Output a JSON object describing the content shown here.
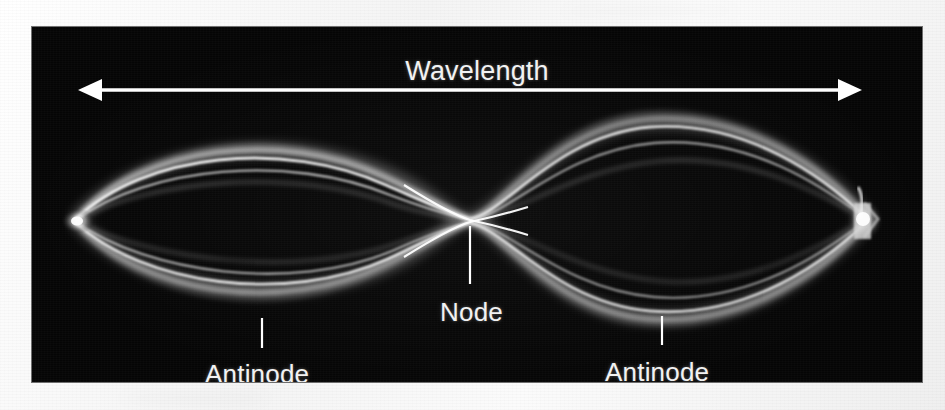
{
  "figure": {
    "kind": "standing-wave-photograph",
    "panel_background": "#050505",
    "mount_background": "#f7f7f7",
    "label_color": "#f2f2f2"
  },
  "labels": {
    "wavelength": "Wavelength",
    "node": "Node",
    "antinode_left": "Antinode",
    "antinode_right": "Antinode"
  },
  "annotations": {
    "dimension_arrow": {
      "name": "wavelength-double-arrow",
      "style": "double-headed",
      "y": 90,
      "x_start": 78,
      "x_end": 860,
      "color": "#ffffff"
    },
    "leaders": [
      {
        "name": "node-leader",
        "x": 470,
        "y_top": 226,
        "y_bottom": 284
      },
      {
        "name": "antinode-left-leader",
        "x": 262,
        "y_top": 318,
        "y_bottom": 348
      },
      {
        "name": "antinode-right-leader",
        "x": 662,
        "y_top": 316,
        "y_bottom": 345
      }
    ]
  },
  "wave": {
    "harmonic": 2,
    "node_count_interior": 1,
    "antinode_count": 2,
    "fixed_end_left_x": 75,
    "fixed_end_right_x": 866,
    "center_node_x": 470,
    "axis_y": 220,
    "peak_amplitude_px": 95
  }
}
